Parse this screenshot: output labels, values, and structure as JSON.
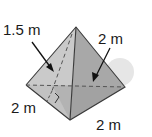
{
  "figure": {
    "type": "triangular-pyramid",
    "labels": {
      "slant_height": "1.5 m",
      "right_face_edge": "2 m",
      "left_base_edge": "2 m",
      "front_base_edge": "2 m"
    },
    "colors": {
      "left_face": "#c9c9c9",
      "right_face": "#a9a9a9",
      "base_left": "#b8b8b8",
      "base_right": "#9d9d9d",
      "edge": "#333333",
      "shadow": "#e2e2e2"
    }
  }
}
